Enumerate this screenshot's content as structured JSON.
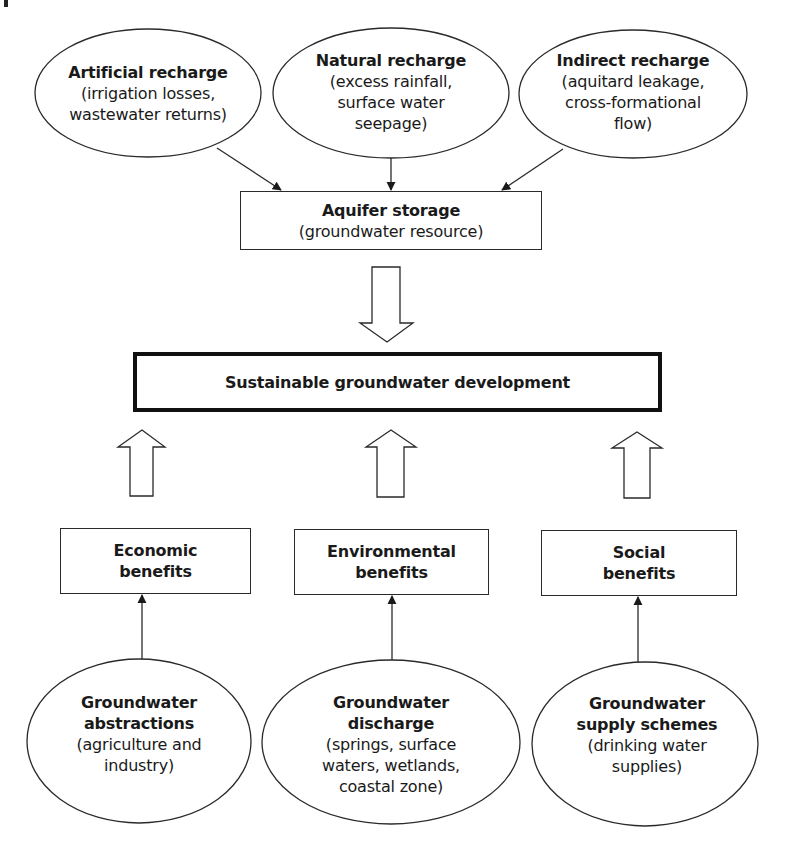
{
  "diagram": {
    "type": "flowchart",
    "colors": {
      "stroke": "#2a2a2a",
      "text": "#1a1a1a",
      "background": "#ffffff"
    },
    "recharge_sources": [
      {
        "id": "artificial",
        "title": "Artificial recharge",
        "lines": [
          "(irrigation losses,",
          "wastewater returns)"
        ]
      },
      {
        "id": "natural",
        "title": "Natural recharge",
        "lines": [
          "(excess rainfall,",
          "surface water",
          "seepage)"
        ]
      },
      {
        "id": "indirect",
        "title": "Indirect recharge",
        "lines": [
          "(aquitard leakage,",
          "cross-formational",
          "flow)"
        ]
      }
    ],
    "storage": {
      "title": "Aquifer storage",
      "subtitle": "(groundwater resource)"
    },
    "goal": {
      "title": "Sustainable groundwater development"
    },
    "benefits": [
      {
        "id": "economic",
        "lines": [
          "Economic",
          "benefits"
        ]
      },
      {
        "id": "environmental",
        "lines": [
          "Environmental",
          "benefits"
        ]
      },
      {
        "id": "social",
        "lines": [
          "Social",
          "benefits"
        ]
      }
    ],
    "uses": [
      {
        "id": "abstractions",
        "title_lines": [
          "Groundwater",
          "abstractions"
        ],
        "lines": [
          "(agriculture and",
          "industry)"
        ]
      },
      {
        "id": "discharge",
        "title_lines": [
          "Groundwater",
          "discharge"
        ],
        "lines": [
          "(springs, surface",
          "waters, wetlands,",
          "coastal zone)"
        ]
      },
      {
        "id": "supply",
        "title_lines": [
          "Groundwater",
          "supply schemes"
        ],
        "lines": [
          "(drinking water",
          "supplies)"
        ]
      }
    ],
    "edges": [
      {
        "from": "artificial",
        "to": "storage",
        "style": "line-arrow"
      },
      {
        "from": "natural",
        "to": "storage",
        "style": "line-arrow"
      },
      {
        "from": "indirect",
        "to": "storage",
        "style": "line-arrow"
      },
      {
        "from": "storage",
        "to": "goal",
        "style": "hollow-block-arrow"
      },
      {
        "from": "economic",
        "to": "goal",
        "style": "hollow-block-arrow"
      },
      {
        "from": "environmental",
        "to": "goal",
        "style": "hollow-block-arrow"
      },
      {
        "from": "social",
        "to": "goal",
        "style": "hollow-block-arrow"
      },
      {
        "from": "abstractions",
        "to": "economic",
        "style": "line-arrow"
      },
      {
        "from": "discharge",
        "to": "environmental",
        "style": "line-arrow"
      },
      {
        "from": "supply",
        "to": "social",
        "style": "line-arrow"
      }
    ]
  }
}
